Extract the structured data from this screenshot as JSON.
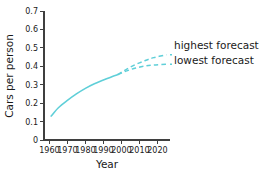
{
  "chart_data": {
    "type": "line",
    "title": "",
    "xlabel": "Year",
    "ylabel": "Cars per person",
    "xlim": [
      1957,
      2027
    ],
    "ylim": [
      0,
      0.7
    ],
    "grid": false,
    "legend_position": "right-inline",
    "xticks": [
      "1960",
      "1970",
      "1980",
      "1990",
      "2000",
      "2010",
      "2020"
    ],
    "xtick_values": [
      1960,
      1970,
      1980,
      1990,
      2000,
      2010,
      2020
    ],
    "yticks": [
      "0",
      "0.1",
      "0.2",
      "0.3",
      "0.4",
      "0.5",
      "0.6",
      "0.7"
    ],
    "ytick_values": [
      0,
      0.1,
      0.2,
      0.3,
      0.4,
      0.5,
      0.6,
      0.7
    ],
    "accent_color": "#5fcfd8",
    "series": [
      {
        "name": "historical",
        "style": "solid",
        "color": "#5fcfd8",
        "x": [
          1961,
          1965,
          1970,
          1975,
          1980,
          1985,
          1990,
          1995,
          1998
        ],
        "values": [
          0.13,
          0.175,
          0.215,
          0.25,
          0.28,
          0.305,
          0.325,
          0.345,
          0.355
        ]
      },
      {
        "name": "highest forecast",
        "style": "dashed",
        "color": "#5fcfd8",
        "x": [
          1998,
          2003,
          2008,
          2013,
          2018,
          2025
        ],
        "values": [
          0.355,
          0.385,
          0.41,
          0.43,
          0.447,
          0.463
        ]
      },
      {
        "name": "lowest forecast",
        "style": "dashed",
        "color": "#5fcfd8",
        "x": [
          1998,
          2003,
          2008,
          2013,
          2018,
          2025
        ],
        "values": [
          0.355,
          0.375,
          0.391,
          0.401,
          0.407,
          0.411
        ]
      }
    ],
    "annotations": [
      {
        "name": "highest-forecast-label",
        "text": "highest forecast"
      },
      {
        "name": "lowest-forecast-label",
        "text": "lowest forecast"
      }
    ]
  },
  "legend": {
    "highest_label": "highest forecast",
    "lowest_label": "lowest forecast"
  },
  "axes": {
    "x_title": "Year",
    "y_title": "Cars per person"
  }
}
